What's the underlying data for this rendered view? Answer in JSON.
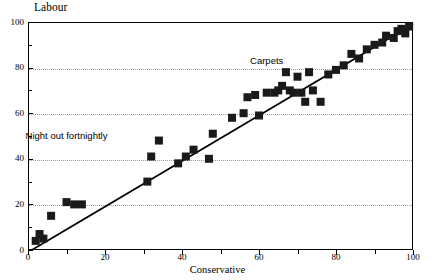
{
  "chart_data": {
    "type": "scatter",
    "title": "",
    "xlabel": "Conservative",
    "ylabel": "Labour",
    "xlim": [
      0,
      100
    ],
    "ylim": [
      0,
      100
    ],
    "grid": "horizontal-dotted",
    "gridline_values": [
      20,
      40,
      60,
      80
    ],
    "xticks": [
      0,
      20,
      40,
      60,
      80,
      100
    ],
    "xtick_labels": [
      "0",
      "20",
      "40",
      "60",
      "80",
      "100"
    ],
    "yticks": [
      0,
      20,
      40,
      60,
      80,
      100
    ],
    "ytick_labels": [
      "0",
      "20",
      "40",
      "60",
      "80",
      "100"
    ],
    "xminor_ticks": [
      10,
      30,
      50,
      70,
      90
    ],
    "yminor_ticks": [
      10,
      30,
      50,
      70,
      90
    ],
    "marker": "filled-square",
    "marker_color": "#1a1a1a",
    "marker_size": 8,
    "legend": null,
    "points": [
      {
        "x": 2,
        "y": 4
      },
      {
        "x": 3,
        "y": 7
      },
      {
        "x": 4,
        "y": 5
      },
      {
        "x": 6,
        "y": 15
      },
      {
        "x": 10,
        "y": 21
      },
      {
        "x": 12,
        "y": 20
      },
      {
        "x": 14,
        "y": 20
      },
      {
        "x": 31,
        "y": 30
      },
      {
        "x": 32,
        "y": 41
      },
      {
        "x": 34,
        "y": 48
      },
      {
        "x": 39,
        "y": 38
      },
      {
        "x": 41,
        "y": 41
      },
      {
        "x": 43,
        "y": 44
      },
      {
        "x": 47,
        "y": 40
      },
      {
        "x": 48,
        "y": 51
      },
      {
        "x": 53,
        "y": 58
      },
      {
        "x": 56,
        "y": 60
      },
      {
        "x": 57,
        "y": 67
      },
      {
        "x": 59,
        "y": 68
      },
      {
        "x": 60,
        "y": 59
      },
      {
        "x": 62,
        "y": 69
      },
      {
        "x": 64,
        "y": 69
      },
      {
        "x": 65,
        "y": 70
      },
      {
        "x": 66,
        "y": 72
      },
      {
        "x": 67,
        "y": 78
      },
      {
        "x": 68,
        "y": 70
      },
      {
        "x": 69,
        "y": 69
      },
      {
        "x": 70,
        "y": 76
      },
      {
        "x": 71,
        "y": 69
      },
      {
        "x": 72,
        "y": 65
      },
      {
        "x": 73,
        "y": 78
      },
      {
        "x": 74,
        "y": 70
      },
      {
        "x": 76,
        "y": 65
      },
      {
        "x": 78,
        "y": 77
      },
      {
        "x": 80,
        "y": 79
      },
      {
        "x": 82,
        "y": 81
      },
      {
        "x": 84,
        "y": 86
      },
      {
        "x": 86,
        "y": 84
      },
      {
        "x": 88,
        "y": 88
      },
      {
        "x": 90,
        "y": 90
      },
      {
        "x": 92,
        "y": 91
      },
      {
        "x": 93,
        "y": 94
      },
      {
        "x": 95,
        "y": 93
      },
      {
        "x": 96,
        "y": 96
      },
      {
        "x": 97,
        "y": 97
      },
      {
        "x": 98,
        "y": 95
      },
      {
        "x": 99,
        "y": 98
      }
    ],
    "trendline": {
      "type": "linear-fit",
      "color": "#000000",
      "from": {
        "x": 1,
        "y": 0
      },
      "to": {
        "x": 100,
        "y": 99
      }
    },
    "annotations": [
      {
        "text": "Carpets",
        "x": 62,
        "y": 83
      },
      {
        "text": "Night out fortnightly",
        "x": 10,
        "y": 50
      }
    ]
  }
}
